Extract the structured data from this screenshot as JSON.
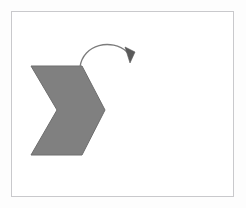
{
  "figure": {
    "canvas": {
      "width": 246,
      "height": 208,
      "background_color": "#fdfdfd"
    },
    "frame": {
      "name": "diagram-border",
      "x": 11,
      "y": 11,
      "width": 223,
      "height": 186,
      "border_color": "#c9c9cc",
      "fill_color": "#ffffff",
      "border_width": 1
    },
    "shape": {
      "name": "chevron",
      "label": "grey chevron arrow pointing right",
      "fill_color": "#808080",
      "stroke_color": "#6e6e6e",
      "stroke_width": 1,
      "points": "31,66 82,66 105,110 82,155 31,155 57,110",
      "vertices": [
        {
          "name": "top-left",
          "x": 31,
          "y": 66
        },
        {
          "name": "top-right",
          "x": 82,
          "y": 66
        },
        {
          "name": "right-tip",
          "x": 105,
          "y": 110
        },
        {
          "name": "bottom-right",
          "x": 82,
          "y": 155
        },
        {
          "name": "bottom-left",
          "x": 31,
          "y": 155
        },
        {
          "name": "inner-notch",
          "x": 57,
          "y": 110
        }
      ]
    },
    "arrow": {
      "name": "rotation-arrow",
      "label": "curved arrow indicating clockwise rotation",
      "stroke_color": "#7c7c7c",
      "stroke_width": 1.3,
      "path": "M 80 67 C 83 44 112 38 127 52",
      "head": {
        "points": "125,47 135,52 130,63",
        "fill_color": "#5a5a5a",
        "direction": "down"
      }
    }
  }
}
